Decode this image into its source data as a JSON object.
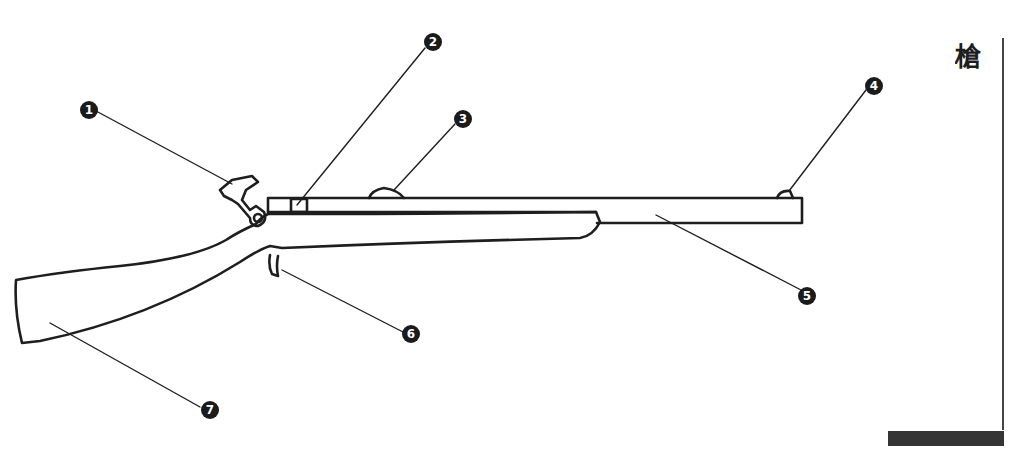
{
  "title": "槍",
  "diagram": {
    "stroke_color": "#1e1e1e",
    "callouts": [
      {
        "number": "1",
        "label_text": "1",
        "part": "hammer"
      },
      {
        "number": "2",
        "label_text": "2",
        "part": "rear sight"
      },
      {
        "number": "3",
        "label_text": "3",
        "part": "barrel band"
      },
      {
        "number": "4",
        "label_text": "4",
        "part": "front sight"
      },
      {
        "number": "5",
        "label_text": "5",
        "part": "barrel"
      },
      {
        "number": "6",
        "label_text": "6",
        "part": "trigger"
      },
      {
        "number": "7",
        "label_text": "7",
        "part": "stock"
      }
    ]
  },
  "decor": {
    "bar_color": "#353535",
    "rule_color": "#444444",
    "callout_fill": "#1b1b1b"
  }
}
